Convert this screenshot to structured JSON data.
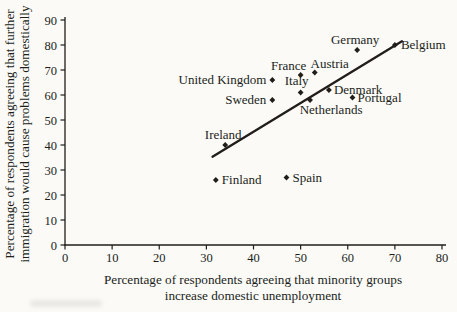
{
  "figure": {
    "background": "#fbfaf7",
    "ink": "#211e1a"
  },
  "chart_data": {
    "type": "scatter",
    "title": "",
    "xlabel_line1": "Percentage of respondents agreeing that minority groups",
    "xlabel_line2": "increase domestic unemployment",
    "ylabel_line1": "Percentage of respondents agreeing that further",
    "ylabel_line2": "immigration would cause problems domestically",
    "xlim": [
      0,
      80
    ],
    "ylim": [
      0,
      90
    ],
    "xticks": [
      0,
      10,
      20,
      30,
      40,
      50,
      60,
      70,
      80
    ],
    "yticks": [
      0,
      10,
      20,
      30,
      40,
      50,
      60,
      70,
      80,
      90
    ],
    "grid": false,
    "legend": "none",
    "marker": "diamond",
    "points": [
      {
        "label": "Finland",
        "x": 32,
        "y": 26,
        "anchor": "start",
        "dx": 6,
        "dy": 4
      },
      {
        "label": "Ireland",
        "x": 34,
        "y": 40,
        "anchor": "middle",
        "dx": -2,
        "dy": -6
      },
      {
        "label": "United Kingdom",
        "x": 44,
        "y": 66,
        "anchor": "end",
        "dx": -6,
        "dy": 4
      },
      {
        "label": "Sweden",
        "x": 44,
        "y": 58,
        "anchor": "end",
        "dx": -6,
        "dy": 4
      },
      {
        "label": "Spain",
        "x": 47,
        "y": 27,
        "anchor": "start",
        "dx": 6,
        "dy": 4
      },
      {
        "label": "France",
        "x": 50,
        "y": 68,
        "anchor": "middle",
        "dx": -12,
        "dy": -5
      },
      {
        "label": "Italy",
        "x": 50,
        "y": 61,
        "anchor": "middle",
        "dx": -4,
        "dy": -8
      },
      {
        "label": "Netherlands",
        "x": 52,
        "y": 58,
        "anchor": "middle",
        "dx": 21,
        "dy": 14
      },
      {
        "label": "Austria",
        "x": 53,
        "y": 69,
        "anchor": "middle",
        "dx": 15,
        "dy": -5
      },
      {
        "label": "Denmark",
        "x": 56,
        "y": 62,
        "anchor": "start",
        "dx": 5,
        "dy": 4
      },
      {
        "label": "Portugal",
        "x": 61,
        "y": 59,
        "anchor": "start",
        "dx": 5,
        "dy": 4
      },
      {
        "label": "Germany",
        "x": 62,
        "y": 78,
        "anchor": "middle",
        "dx": -2,
        "dy": -6
      },
      {
        "label": "Belgium",
        "x": 70,
        "y": 80,
        "anchor": "start",
        "dx": 6,
        "dy": 4
      }
    ],
    "trendline": {
      "x1": 31.3,
      "y1": 35.3,
      "x2": 71.5,
      "y2": 81.5
    }
  }
}
